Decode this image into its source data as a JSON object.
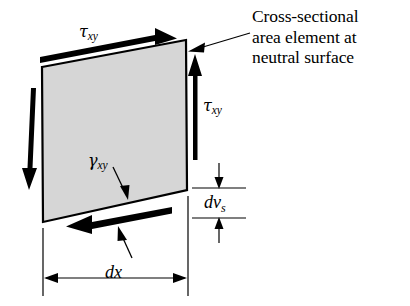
{
  "figure": {
    "type": "engineering-diagram",
    "background_color": "#ffffff",
    "ink_color": "#000000"
  },
  "element": {
    "name": "cross-sectional-area-element",
    "shape": "parallelogram",
    "fill_color": "#d6d6d6",
    "stroke_color": "#000000",
    "corners": {
      "top_left": [
        42,
        67
      ],
      "top_right": [
        186,
        40
      ],
      "bottom_right": [
        187,
        190
      ],
      "bottom_left": [
        43,
        222
      ]
    }
  },
  "callout": {
    "line1": "Cross-sectional",
    "line2": "area element at",
    "line3": "neutral surface",
    "leader": "arrow pointing left to top-right corner of element"
  },
  "labels": {
    "tau_top": {
      "symbol": "τ",
      "subscript": "xy"
    },
    "tau_right": {
      "symbol": "τ",
      "subscript": "xy"
    },
    "gamma": {
      "symbol": "γ",
      "subscript": "xy"
    },
    "dvs": {
      "symbol": "dv",
      "subscript": "s"
    },
    "dx": {
      "symbol": "dx",
      "subscript": ""
    }
  },
  "shear_arrows": [
    {
      "name": "top-shear-arrow",
      "direction": "right",
      "style": "tapered-wedge"
    },
    {
      "name": "bottom-shear-arrow",
      "direction": "left",
      "style": "tapered-wedge"
    },
    {
      "name": "left-shear-arrow",
      "direction": "down",
      "style": "tapered-wedge"
    },
    {
      "name": "right-shear-arrow",
      "direction": "up",
      "style": "tapered-wedge"
    }
  ],
  "dimensions": [
    {
      "name": "dx",
      "orientation": "horizontal",
      "label": "dx",
      "from_x": 43,
      "to_x": 188,
      "at_y": 278
    },
    {
      "name": "dvs",
      "orientation": "vertical",
      "label": "dvs",
      "from_y": 188,
      "to_y": 218,
      "at_x": 219
    }
  ]
}
